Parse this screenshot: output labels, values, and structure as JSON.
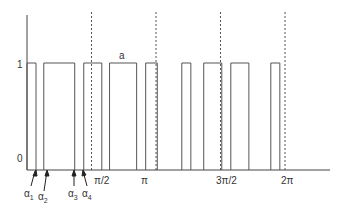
{
  "diagram": {
    "y_labels": {
      "high": "1",
      "low": "0"
    },
    "pulse_label": "a",
    "x_labels": [
      "π/2",
      "π",
      "3π/2",
      "2π"
    ],
    "alpha_labels": [
      {
        "base": "α",
        "sub": "1"
      },
      {
        "base": "α",
        "sub": "2"
      },
      {
        "base": "α",
        "sub": "3"
      },
      {
        "base": "α",
        "sub": "4"
      }
    ],
    "pulses_in_units_of_pi": [
      [
        0.0,
        0.07
      ],
      [
        0.13,
        0.37
      ],
      [
        0.44,
        0.58
      ],
      [
        0.64,
        0.85
      ],
      [
        0.92,
        1.01
      ],
      [
        1.2,
        1.27
      ],
      [
        1.37,
        1.51
      ],
      [
        1.58,
        1.72
      ],
      [
        1.89,
        1.96
      ]
    ],
    "dashed_markers_in_units_of_pi": [
      0.5,
      1.0,
      1.5,
      2.0
    ]
  }
}
